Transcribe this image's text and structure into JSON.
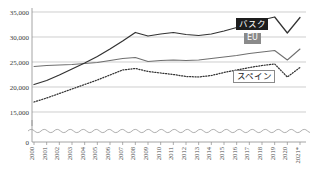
{
  "chart_data": {
    "type": "line",
    "title": "",
    "xlabel": "",
    "ylabel": "",
    "grid": true,
    "legend_position": "inline-labels",
    "ylim": [
      15000,
      36000
    ],
    "yticks": [
      "0",
      "15,000",
      "20,000",
      "25,000",
      "30,000",
      "35,000"
    ],
    "ytick_values": [
      0,
      15000,
      20000,
      25000,
      30000,
      35000
    ],
    "axis_break": true,
    "axis_break_note": "wavy break between 0 and 15,000",
    "categories": [
      "2000",
      "2001",
      "2002",
      "2003",
      "2004",
      "2005",
      "2006",
      "2007",
      "2008",
      "2009",
      "2010",
      "2011",
      "2012",
      "2013",
      "2014",
      "2015",
      "2016",
      "2017",
      "2018",
      "2019",
      "2020",
      "2021*"
    ],
    "series": [
      {
        "name": "バスク",
        "style": "solid-dark",
        "color": "#333333",
        "values": [
          20500,
          21300,
          22400,
          23600,
          24800,
          26100,
          27600,
          29200,
          30900,
          30200,
          30600,
          30900,
          30500,
          30300,
          30600,
          31200,
          31900,
          32700,
          33400,
          34000,
          30800,
          33900
        ]
      },
      {
        "name": "EU",
        "style": "solid-gray",
        "color": "#6f6f6f",
        "values": [
          24100,
          24300,
          24400,
          24500,
          24700,
          24900,
          25300,
          25700,
          25900,
          25100,
          25300,
          25400,
          25300,
          25400,
          25700,
          26000,
          26300,
          26700,
          27000,
          27300,
          25400,
          27600
        ]
      },
      {
        "name": "スペイン",
        "style": "dotted-dark",
        "color": "#333333",
        "values": [
          17000,
          17800,
          18700,
          19600,
          20500,
          21400,
          22400,
          23400,
          23700,
          23100,
          22800,
          22500,
          22100,
          22000,
          22300,
          22900,
          23400,
          23900,
          24300,
          24600,
          22000,
          23900
        ]
      }
    ],
    "labels": [
      {
        "text": "バスク",
        "style": "dark-box"
      },
      {
        "text": "EU",
        "style": "gray-box"
      },
      {
        "text": "スペイン",
        "style": "white-box"
      }
    ]
  }
}
